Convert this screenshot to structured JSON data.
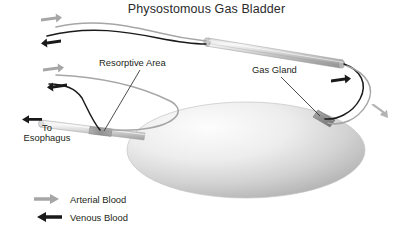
{
  "figure": {
    "title": "Physostomous Gas Bladder",
    "background_color": "#ffffff",
    "text_color": "#231f20"
  },
  "labels": {
    "resorptive_area": "Resorptive Area",
    "gas_gland": "Gas Gland",
    "to_esophagus_line1": "To",
    "to_esophagus_line2": "Esophagus"
  },
  "legend": {
    "items": [
      {
        "label": "Arterial Blood",
        "color": "#a6a6a6",
        "direction": "right",
        "icon": "arrow-right-icon"
      },
      {
        "label": "Venous Blood",
        "color": "#1a1a1a",
        "direction": "left",
        "icon": "arrow-left-icon"
      }
    ]
  },
  "anatomy": {
    "bladder": {
      "name": "gas bladder",
      "fill_light": "#fbfbfb",
      "fill_dark": "#b8b8b8"
    },
    "rete": {
      "name": "rete mirabile vessel",
      "fill_light": "#f2f2f2",
      "fill_dark": "#9a9a9a"
    },
    "pneumatic_duct": {
      "name": "pneumatic duct",
      "fill_light": "#f4f4f4",
      "fill_dark": "#a8a8a8"
    },
    "gas_gland_patch": {
      "name": "gas gland",
      "fill": "#8d8d8d"
    },
    "resorptive_patch": {
      "name": "resorptive area",
      "fill": "#9b9b9b"
    }
  },
  "vessels": {
    "arterial_color": "#a6a6a6",
    "venous_color": "#1a1a1a",
    "leader_color": "#3a3a3a"
  },
  "flow_arrows": [
    {
      "name": "arterial-arrow-upper-left",
      "type": "arterial",
      "direction": "right"
    },
    {
      "name": "venous-arrow-upper-left",
      "type": "venous",
      "direction": "left"
    },
    {
      "name": "arterial-arrow-mid-left",
      "type": "arterial",
      "direction": "right"
    },
    {
      "name": "venous-arrow-mid-left",
      "type": "venous",
      "direction": "left"
    },
    {
      "name": "venous-arrow-right",
      "type": "venous",
      "direction": "right"
    },
    {
      "name": "arterial-arrow-right",
      "type": "arterial",
      "direction": "down-right"
    },
    {
      "name": "duct-outflow-arrow",
      "type": "venous",
      "direction": "left"
    }
  ]
}
